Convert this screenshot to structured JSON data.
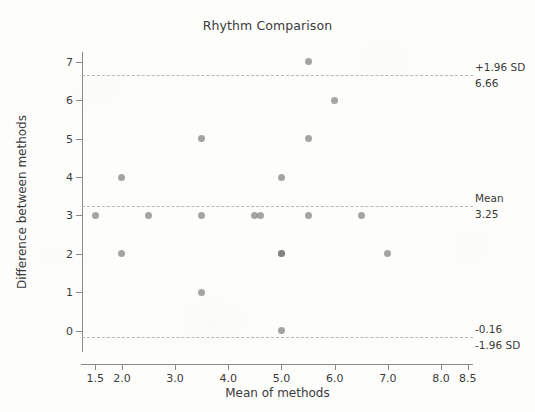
{
  "chart_data": {
    "type": "scatter",
    "title": "Rhythm Comparison",
    "xlabel": "Mean of methods",
    "ylabel": "Difference between methods",
    "xlim": [
      1.25,
      8.6
    ],
    "ylim": [
      -0.55,
      7.25
    ],
    "grid": false,
    "legend": "none",
    "x_ticks": [
      "1.5",
      "2.0",
      "3.0",
      "4.0",
      "5.0",
      "6.0",
      "7.0",
      "8.0",
      "8.5"
    ],
    "x_tick_values": [
      1.5,
      2.0,
      3.0,
      4.0,
      5.0,
      6.0,
      7.0,
      8.0,
      8.5
    ],
    "y_ticks": [
      "0",
      "1",
      "2",
      "3",
      "4",
      "5",
      "6",
      "7"
    ],
    "y_tick_values": [
      0,
      1,
      2,
      3,
      4,
      5,
      6,
      7
    ],
    "marker_color": "#6e6e6e",
    "reference_line_color": "#b9b9b9",
    "points": [
      {
        "x": 5.5,
        "y": 7
      },
      {
        "x": 6.0,
        "y": 6
      },
      {
        "x": 3.5,
        "y": 5
      },
      {
        "x": 5.5,
        "y": 5
      },
      {
        "x": 2.0,
        "y": 4
      },
      {
        "x": 5.0,
        "y": 4
      },
      {
        "x": 1.5,
        "y": 3
      },
      {
        "x": 2.5,
        "y": 3
      },
      {
        "x": 3.5,
        "y": 3
      },
      {
        "x": 4.5,
        "y": 3
      },
      {
        "x": 4.6,
        "y": 3
      },
      {
        "x": 5.5,
        "y": 3
      },
      {
        "x": 6.5,
        "y": 3
      },
      {
        "x": 2.0,
        "y": 2
      },
      {
        "x": 5.0,
        "y": 2
      },
      {
        "x": 5.0,
        "y": 2
      },
      {
        "x": 7.0,
        "y": 2
      },
      {
        "x": 3.5,
        "y": 1
      },
      {
        "x": 5.0,
        "y": 0
      }
    ],
    "reference_lines": [
      {
        "id": "upper-loa",
        "value": 6.66,
        "label_above": "+1.96 SD",
        "label_below": "6.66"
      },
      {
        "id": "mean",
        "value": 3.25,
        "label_above": "Mean",
        "label_below": "3.25"
      },
      {
        "id": "lower-loa",
        "value": -0.16,
        "label_above": "-0.16",
        "label_below": "-1.96 SD"
      }
    ]
  }
}
